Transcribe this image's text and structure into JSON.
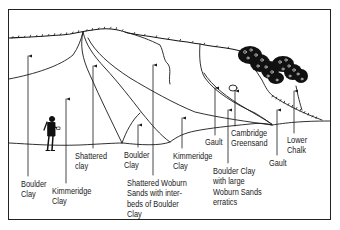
{
  "diagram": {
    "type": "geological-cross-section",
    "colors": {
      "line": "#1a1a1a",
      "background": "#ffffff",
      "vegetation": "#111111"
    },
    "labels": [
      {
        "id": "boulder-clay-left",
        "text": "Boulder\nClay",
        "x": 21,
        "y": 180
      },
      {
        "id": "kimmeridge-clay-left",
        "text": "Kimmeridge\nClay",
        "x": 52,
        "y": 187
      },
      {
        "id": "shattered-clay",
        "text": "Shattered\nclay",
        "x": 75,
        "y": 152
      },
      {
        "id": "boulder-clay-center",
        "text": "Boulder\nClay",
        "x": 124,
        "y": 151
      },
      {
        "id": "shattered-woburn-sands",
        "text": "Shattered Woburn\nSands with inter-\nbeds of Boulder\nClay",
        "x": 127,
        "y": 179
      },
      {
        "id": "kimmeridge-clay-center",
        "text": "Kimmeridge\nClay",
        "x": 173,
        "y": 152
      },
      {
        "id": "gault-center",
        "text": "Gault",
        "x": 205,
        "y": 138
      },
      {
        "id": "cambridge-greensand",
        "text": "Cambridge\nGreensand",
        "x": 231,
        "y": 129
      },
      {
        "id": "boulder-clay-erratics",
        "text": "Boulder Clay\nwith large\nWoburn Sands\nerratics",
        "x": 213,
        "y": 167
      },
      {
        "id": "gault-right",
        "text": "Gault",
        "x": 269,
        "y": 159
      },
      {
        "id": "lower-chalk",
        "text": "Lower\nChalk",
        "x": 287,
        "y": 136
      }
    ]
  }
}
